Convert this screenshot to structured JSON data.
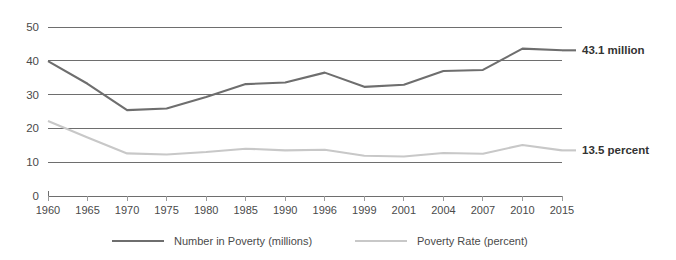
{
  "chart_data": {
    "type": "line",
    "title": "",
    "xlabel": "",
    "ylabel": "",
    "ylim": [
      0,
      50
    ],
    "yticks": [
      0,
      10,
      20,
      30,
      40,
      50
    ],
    "grid": true,
    "legend_position": "bottom",
    "categories": [
      "1960",
      "1965",
      "1970",
      "1975",
      "1980",
      "1985",
      "1990",
      "1996",
      "1999",
      "2001",
      "2004",
      "2007",
      "2010",
      "2015"
    ],
    "series": [
      {
        "name": "Number in Poverty (millions)",
        "color": "#6e6e6e",
        "values": [
          39.9,
          33.2,
          25.4,
          25.9,
          29.3,
          33.1,
          33.6,
          36.5,
          32.3,
          32.9,
          37.0,
          37.3,
          43.6,
          43.1
        ],
        "end_label": "43.1 million"
      },
      {
        "name": "Poverty Rate (percent)",
        "color": "#c8c8c8",
        "values": [
          22.2,
          17.3,
          12.6,
          12.3,
          13.0,
          14.0,
          13.5,
          13.7,
          11.9,
          11.7,
          12.7,
          12.5,
          15.1,
          13.5
        ],
        "end_label": "13.5 percent"
      }
    ]
  },
  "annotations": {
    "number_in_poverty_label": "43.1 million",
    "poverty_rate_label": "13.5 percent"
  },
  "legend": {
    "items": [
      {
        "label": "Number in Poverty (millions)",
        "color": "#6e6e6e"
      },
      {
        "label": "Poverty Rate (percent)",
        "color": "#c8c8c8"
      }
    ]
  },
  "axis": {
    "y_tick_labels": [
      "50",
      "40",
      "30",
      "20",
      "10",
      "0"
    ],
    "x_tick_labels": [
      "1960",
      "1965",
      "1970",
      "1975",
      "1980",
      "1985",
      "1990",
      "1996",
      "1999",
      "2001",
      "2004",
      "2007",
      "2010",
      "2015"
    ]
  }
}
